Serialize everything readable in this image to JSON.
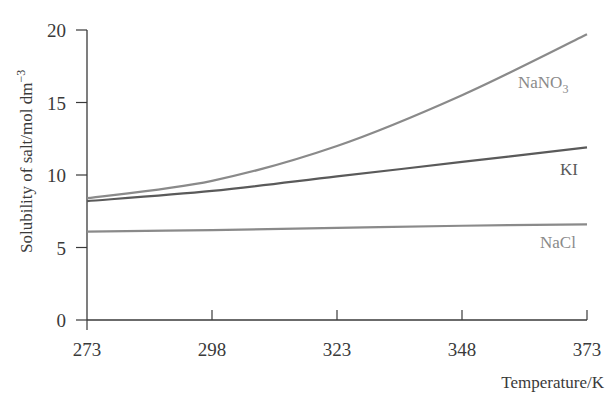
{
  "chart_data": {
    "type": "line",
    "title": "",
    "xlabel": "Temperature/K",
    "ylabel": "Solubility of salt/mol dm⁻³",
    "x": [
      273,
      298,
      323,
      348,
      373
    ],
    "xticks": [
      "273",
      "298",
      "323",
      "348",
      "373"
    ],
    "yticks": [
      "0",
      "5",
      "10",
      "15",
      "20"
    ],
    "xlim": [
      273,
      373
    ],
    "ylim": [
      0,
      20
    ],
    "grid": false,
    "legend_position": "inline labels at right end of lines",
    "series": [
      {
        "name": "NaNO3",
        "label": "NaNO",
        "label_sub": "3",
        "color": "#8a8a8a",
        "values": [
          8.4,
          9.6,
          12.0,
          15.5,
          19.7
        ]
      },
      {
        "name": "KI",
        "label": "KI",
        "color": "#5a5a5a",
        "values": [
          8.2,
          8.9,
          9.9,
          10.9,
          11.9
        ]
      },
      {
        "name": "NaCl",
        "label": "NaCl",
        "color": "#8a8a8a",
        "values": [
          6.1,
          6.2,
          6.35,
          6.5,
          6.6
        ]
      }
    ]
  },
  "axes": {
    "x_title": "Temperature/K",
    "y_title_main": "Solubility of salt/mol dm",
    "y_title_sup": "−3"
  }
}
